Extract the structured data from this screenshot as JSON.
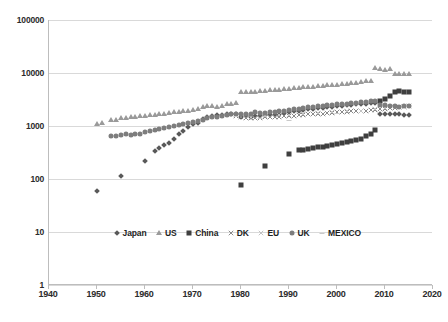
{
  "chart_data": {
    "type": "scatter",
    "title": "",
    "subtitle": "",
    "xlabel": "",
    "ylabel": "",
    "yscale": "log",
    "xscale": "linear",
    "xlim": [
      1940,
      2020
    ],
    "ylim": [
      1,
      100000
    ],
    "xticks": [
      1940,
      1950,
      1960,
      1970,
      1980,
      1990,
      2000,
      2010,
      2020
    ],
    "yticks": [
      1,
      10,
      100,
      1000,
      10000,
      100000
    ],
    "grid": "horizontal",
    "legend_position": "inside-bottom-center",
    "series": [
      {
        "name": "Japan",
        "marker": "diamond",
        "color": "#595959",
        "points": [
          [
            1950,
            60
          ],
          [
            1955,
            112
          ],
          [
            1960,
            220
          ],
          [
            1962,
            335
          ],
          [
            1963,
            380
          ],
          [
            1964,
            440
          ],
          [
            1965,
            470
          ],
          [
            1966,
            560
          ],
          [
            1967,
            700
          ],
          [
            1968,
            800
          ],
          [
            1969,
            960
          ],
          [
            1970,
            1100
          ],
          [
            1971,
            1150
          ],
          [
            1972,
            1350
          ],
          [
            1973,
            1500
          ],
          [
            1974,
            1550
          ],
          [
            1975,
            1580
          ],
          [
            1976,
            1620
          ],
          [
            1977,
            1660
          ],
          [
            1978,
            1700
          ],
          [
            1979,
            1720
          ],
          [
            1980,
            1500
          ],
          [
            1981,
            1520
          ],
          [
            1982,
            1500
          ],
          [
            1983,
            1530
          ],
          [
            1984,
            1560
          ],
          [
            1985,
            1580
          ],
          [
            1986,
            1600
          ],
          [
            1987,
            1640
          ],
          [
            1988,
            1700
          ],
          [
            1989,
            1760
          ],
          [
            1990,
            1820
          ],
          [
            1991,
            1880
          ],
          [
            1992,
            1950
          ],
          [
            1993,
            2000
          ],
          [
            1994,
            2060
          ],
          [
            1995,
            2120
          ],
          [
            1996,
            2180
          ],
          [
            1997,
            2220
          ],
          [
            1998,
            2260
          ],
          [
            1999,
            2300
          ],
          [
            2000,
            2350
          ],
          [
            2001,
            2400
          ],
          [
            2002,
            2450
          ],
          [
            2003,
            2500
          ],
          [
            2004,
            2550
          ],
          [
            2005,
            2600
          ],
          [
            2006,
            2650
          ],
          [
            2007,
            2700
          ],
          [
            2008,
            2750
          ],
          [
            2009,
            1700
          ],
          [
            2010,
            1720
          ],
          [
            2011,
            1680
          ],
          [
            2012,
            1660
          ],
          [
            2013,
            1650
          ],
          [
            2014,
            1620
          ],
          [
            2015,
            1620
          ]
        ]
      },
      {
        "name": "US",
        "marker": "triangle",
        "color": "#9a9a9a",
        "points": [
          [
            1950,
            1100
          ],
          [
            1951,
            1120
          ],
          [
            1953,
            1300
          ],
          [
            1954,
            1320
          ],
          [
            1955,
            1400
          ],
          [
            1956,
            1430
          ],
          [
            1957,
            1450
          ],
          [
            1958,
            1480
          ],
          [
            1959,
            1520
          ],
          [
            1960,
            1550
          ],
          [
            1961,
            1580
          ],
          [
            1962,
            1620
          ],
          [
            1963,
            1660
          ],
          [
            1964,
            1700
          ],
          [
            1965,
            1760
          ],
          [
            1966,
            1800
          ],
          [
            1967,
            1850
          ],
          [
            1968,
            1900
          ],
          [
            1969,
            1960
          ],
          [
            1970,
            2000
          ],
          [
            1971,
            2050
          ],
          [
            1972,
            2300
          ],
          [
            1973,
            2400
          ],
          [
            1974,
            2350
          ],
          [
            1975,
            2300
          ],
          [
            1976,
            2420
          ],
          [
            1977,
            2550
          ],
          [
            1978,
            2650
          ],
          [
            1979,
            2700
          ],
          [
            1980,
            4300
          ],
          [
            1981,
            4350
          ],
          [
            1982,
            4380
          ],
          [
            1983,
            4420
          ],
          [
            1984,
            4500
          ],
          [
            1985,
            4600
          ],
          [
            1986,
            4680
          ],
          [
            1987,
            4750
          ],
          [
            1988,
            4850
          ],
          [
            1989,
            4950
          ],
          [
            1990,
            5050
          ],
          [
            1991,
            5150
          ],
          [
            1992,
            5250
          ],
          [
            1993,
            5350
          ],
          [
            1994,
            5450
          ],
          [
            1995,
            5550
          ],
          [
            1996,
            5650
          ],
          [
            1997,
            5750
          ],
          [
            1998,
            5850
          ],
          [
            1999,
            5950
          ],
          [
            2000,
            6050
          ],
          [
            2001,
            6150
          ],
          [
            2002,
            6300
          ],
          [
            2003,
            6450
          ],
          [
            2004,
            6600
          ],
          [
            2005,
            6800
          ],
          [
            2006,
            7000
          ],
          [
            2007,
            7200
          ],
          [
            2008,
            12400
          ],
          [
            2009,
            11800
          ],
          [
            2010,
            11500
          ],
          [
            2011,
            11700
          ],
          [
            2012,
            9500
          ],
          [
            2013,
            9600
          ],
          [
            2014,
            9700
          ],
          [
            2015,
            9700
          ]
        ]
      },
      {
        "name": "China",
        "marker": "square",
        "color": "#3f3f3f",
        "points": [
          [
            1980,
            78
          ],
          [
            1985,
            175
          ],
          [
            1990,
            290
          ],
          [
            1992,
            350
          ],
          [
            1993,
            360
          ],
          [
            1994,
            370
          ],
          [
            1995,
            380
          ],
          [
            1996,
            395
          ],
          [
            1997,
            410
          ],
          [
            1998,
            425
          ],
          [
            1999,
            440
          ],
          [
            2000,
            455
          ],
          [
            2001,
            470
          ],
          [
            2002,
            490
          ],
          [
            2003,
            510
          ],
          [
            2004,
            540
          ],
          [
            2005,
            580
          ],
          [
            2006,
            640
          ],
          [
            2007,
            720
          ],
          [
            2008,
            850
          ],
          [
            2009,
            2900
          ],
          [
            2010,
            3300
          ],
          [
            2011,
            3700
          ],
          [
            2012,
            4400
          ],
          [
            2013,
            4500
          ],
          [
            2014,
            4400
          ],
          [
            2015,
            4300
          ]
        ]
      },
      {
        "name": "DK",
        "marker": "x-cross",
        "color": "#8a8a8a",
        "points": [
          [
            1979,
            1550
          ],
          [
            1980,
            1500
          ],
          [
            1981,
            1420
          ],
          [
            1982,
            1400
          ],
          [
            1983,
            1420
          ],
          [
            1984,
            1440
          ],
          [
            1985,
            1450
          ],
          [
            1986,
            1470
          ],
          [
            1987,
            1480
          ],
          [
            1988,
            1500
          ],
          [
            1989,
            1520
          ],
          [
            1990,
            1550
          ],
          [
            1991,
            1570
          ],
          [
            1992,
            1600
          ],
          [
            1993,
            1620
          ],
          [
            1994,
            1650
          ],
          [
            1995,
            1680
          ],
          [
            1996,
            1700
          ],
          [
            1997,
            1720
          ],
          [
            1998,
            1750
          ],
          [
            1999,
            1780
          ],
          [
            2000,
            1800
          ],
          [
            2001,
            1830
          ],
          [
            2002,
            1850
          ],
          [
            2003,
            1880
          ],
          [
            2004,
            1900
          ],
          [
            2005,
            1930
          ],
          [
            2006,
            1950
          ],
          [
            2007,
            1980
          ],
          [
            2008,
            2000
          ],
          [
            2009,
            2050
          ],
          [
            2010,
            2100
          ],
          [
            2011,
            2150
          ],
          [
            2012,
            2200
          ],
          [
            2013,
            2250
          ],
          [
            2014,
            2300
          ],
          [
            2015,
            2350
          ]
        ]
      },
      {
        "name": "EU",
        "marker": "x-cross-light",
        "color": "#c2c2c2",
        "points": [
          [
            1979,
            1580
          ],
          [
            1982,
            1480
          ],
          [
            1985,
            1520
          ],
          [
            1988,
            1580
          ],
          [
            1990,
            1620
          ],
          [
            1993,
            1680
          ],
          [
            1996,
            1750
          ],
          [
            1999,
            1820
          ],
          [
            2002,
            1880
          ],
          [
            2005,
            1960
          ],
          [
            2008,
            2050
          ],
          [
            2010,
            2150
          ],
          [
            2012,
            2250
          ],
          [
            2014,
            2320
          ]
        ]
      },
      {
        "name": "UK",
        "marker": "circle",
        "color": "#7d7d7d",
        "points": [
          [
            1953,
            640
          ],
          [
            1954,
            660
          ],
          [
            1955,
            690
          ],
          [
            1956,
            700
          ],
          [
            1957,
            690
          ],
          [
            1958,
            700
          ],
          [
            1959,
            720
          ],
          [
            1960,
            760
          ],
          [
            1961,
            800
          ],
          [
            1962,
            840
          ],
          [
            1963,
            880
          ],
          [
            1964,
            920
          ],
          [
            1965,
            960
          ],
          [
            1966,
            1000
          ],
          [
            1967,
            1050
          ],
          [
            1968,
            1100
          ],
          [
            1969,
            1150
          ],
          [
            1970,
            1200
          ],
          [
            1971,
            1260
          ],
          [
            1972,
            1320
          ],
          [
            1973,
            1400
          ],
          [
            1974,
            1450
          ],
          [
            1975,
            1500
          ],
          [
            1976,
            1560
          ],
          [
            1977,
            1620
          ],
          [
            1978,
            1660
          ],
          [
            1979,
            1700
          ],
          [
            1980,
            1680
          ],
          [
            1981,
            1650
          ],
          [
            1982,
            1700
          ],
          [
            1983,
            1800
          ],
          [
            1984,
            1750
          ],
          [
            1985,
            1780
          ],
          [
            1986,
            1820
          ],
          [
            1987,
            1850
          ],
          [
            1988,
            1900
          ],
          [
            1989,
            1950
          ],
          [
            1990,
            2000
          ],
          [
            1991,
            2050
          ],
          [
            1992,
            2120
          ],
          [
            1993,
            2200
          ],
          [
            1994,
            2250
          ],
          [
            1995,
            2300
          ],
          [
            1996,
            2350
          ],
          [
            1997,
            2400
          ],
          [
            1998,
            2450
          ],
          [
            1999,
            2500
          ],
          [
            2000,
            2550
          ],
          [
            2001,
            2600
          ],
          [
            2002,
            2650
          ],
          [
            2003,
            2700
          ],
          [
            2004,
            2750
          ],
          [
            2005,
            2800
          ],
          [
            2006,
            2850
          ],
          [
            2007,
            2900
          ],
          [
            2008,
            2950
          ],
          [
            2009,
            2500
          ],
          [
            2010,
            2450
          ],
          [
            2011,
            2400
          ],
          [
            2012,
            2350
          ],
          [
            2013,
            2300
          ],
          [
            2014,
            2350
          ],
          [
            2015,
            2400
          ]
        ]
      },
      {
        "name": "MEXICO",
        "marker": "dash",
        "color": "#c9c9c9",
        "points": [
          [
            1979,
            1550
          ],
          [
            1984,
            1400
          ],
          [
            1990,
            1300
          ],
          [
            2000,
            1750
          ]
        ]
      }
    ]
  },
  "legend": {
    "items": [
      {
        "label": "Japan",
        "marker": "diamond",
        "color": "#595959"
      },
      {
        "label": "US",
        "marker": "triangle",
        "color": "#9a9a9a"
      },
      {
        "label": "China",
        "marker": "square",
        "color": "#3f3f3f"
      },
      {
        "label": "DK",
        "marker": "x-cross",
        "color": "#8a8a8a"
      },
      {
        "label": "EU",
        "marker": "x-cross-light",
        "color": "#c2c2c2"
      },
      {
        "label": "UK",
        "marker": "circle",
        "color": "#7d7d7d"
      },
      {
        "label": "MEXICO",
        "marker": "dash",
        "color": "#c9c9c9"
      }
    ]
  },
  "axes": {
    "y_tick_labels": [
      "100000",
      "10000",
      "1000",
      "100",
      "10",
      "1"
    ],
    "x_tick_labels": [
      "1940",
      "1950",
      "1960",
      "1970",
      "1980",
      "1990",
      "2000",
      "2010",
      "2020"
    ]
  },
  "style": {
    "background": "#ffffff",
    "gridline_color": "#d9d9d9",
    "axis_color": "#bdbdbd",
    "text_color": "#2b2b2b"
  }
}
